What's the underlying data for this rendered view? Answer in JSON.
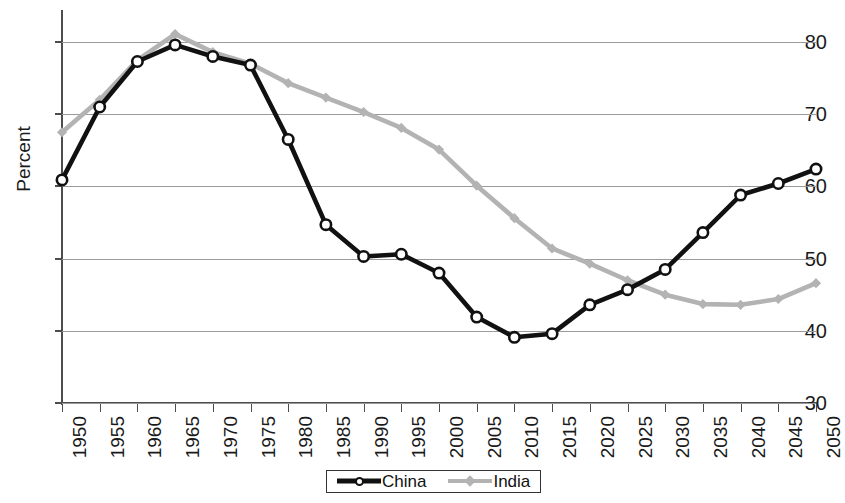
{
  "chart_data": {
    "type": "line",
    "title": "",
    "subtitle": "",
    "xlabel": "",
    "ylabel": "Percent",
    "x": [
      1950,
      1955,
      1960,
      1965,
      1970,
      1975,
      1980,
      1985,
      1990,
      1995,
      2000,
      2005,
      2010,
      2015,
      2020,
      2025,
      2030,
      2035,
      2040,
      2045,
      2050
    ],
    "xtick_labels": [
      "1950",
      "1955",
      "1960",
      "1965",
      "1970",
      "1975",
      "1980",
      "1985",
      "1990",
      "1995",
      "2000",
      "2005",
      "2010",
      "2015",
      "2020",
      "2025",
      "2030",
      "2035",
      "2040",
      "2045",
      "2050"
    ],
    "ytick_labels": [
      "30",
      "40",
      "50",
      "60",
      "70",
      "80"
    ],
    "ytick_values": [
      30,
      40,
      50,
      60,
      70,
      80
    ],
    "ylim": [
      30,
      84
    ],
    "xlim": [
      1950,
      2050
    ],
    "grid": "horizontal",
    "legend_position": "bottom-center",
    "series": [
      {
        "name": "China",
        "color": "#111111",
        "marker": "circle-open",
        "values": [
          60.9,
          71.0,
          77.3,
          79.6,
          78.0,
          76.8,
          66.5,
          54.7,
          50.3,
          50.6,
          48.0,
          41.9,
          39.1,
          39.6,
          43.6,
          45.7,
          48.5,
          53.6,
          58.8,
          60.4,
          62.4
        ]
      },
      {
        "name": "India",
        "color": "#b3b3b3",
        "marker": "diamond",
        "values": [
          67.5,
          72.0,
          77.5,
          81.1,
          78.6,
          77.0,
          74.3,
          72.3,
          70.3,
          68.1,
          65.1,
          60.1,
          55.6,
          51.4,
          49.3,
          47.0,
          45.0,
          43.7,
          43.6,
          44.4,
          46.6
        ]
      }
    ],
    "legend": [
      {
        "label": "China",
        "color": "#111111",
        "marker": "circle-open"
      },
      {
        "label": "India",
        "color": "#b3b3b3",
        "marker": "diamond"
      }
    ]
  }
}
